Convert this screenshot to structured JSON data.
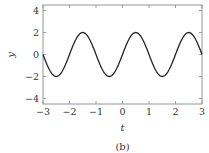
{
  "chart_data": {
    "type": "line",
    "title": "",
    "caption": "(b)",
    "xlabel": "t",
    "ylabel": "y",
    "xlim": [
      -3,
      3
    ],
    "ylim": [
      -4.5,
      4.5
    ],
    "xticks": [
      -3,
      -2,
      -1,
      0,
      1,
      2,
      3
    ],
    "xtick_labels": [
      "−3",
      "−2",
      "−1",
      "0",
      "1",
      "2",
      "3"
    ],
    "yticks": [
      -4,
      -2,
      0,
      2,
      4
    ],
    "ytick_labels": [
      "−4",
      "−2",
      "0",
      "2",
      "4"
    ],
    "grid": false,
    "legend": null,
    "series": [
      {
        "name": "y(t)",
        "function": "2*sin(pi*t)",
        "color": "#222222",
        "x": [
          -3,
          -2.5,
          -2,
          -1.5,
          -1,
          -0.5,
          0,
          0.5,
          1,
          1.5,
          2,
          2.5,
          3
        ],
        "y": [
          0,
          -2,
          0,
          2,
          0,
          -2,
          0,
          2,
          0,
          -2,
          0,
          2,
          0
        ]
      }
    ]
  },
  "colors": {
    "frame": "#8a8a8a",
    "line": "#222222",
    "text": "#333333"
  }
}
